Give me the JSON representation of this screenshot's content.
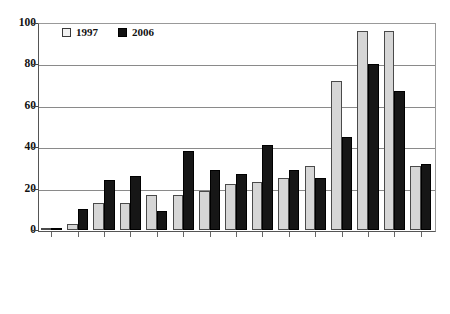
{
  "chart_data": {
    "type": "bar",
    "title": "",
    "subtitle": "",
    "xlabel": "",
    "ylabel": "",
    "ylim": [
      0,
      100
    ],
    "yticks": [
      0,
      20,
      40,
      60,
      80,
      100
    ],
    "grid": true,
    "legend_position": "top-left",
    "categories": [
      "MYANMAR",
      "JAPAN",
      "CHINA",
      "INDIA",
      "BRUNEI",
      "KOREA",
      "PHILIPPINES",
      "INDONESIA",
      "MALAYSIA",
      "THAILAND",
      "HONGKONG",
      "LAOS",
      "SINGAPORE",
      "CAMBODIA",
      "AVERAGE"
    ],
    "series": [
      {
        "name": "1997",
        "color": "#d6d6d6",
        "values": [
          1,
          3,
          13,
          13,
          17,
          17,
          19,
          22,
          23,
          25,
          31,
          72,
          96,
          96,
          31
        ]
      },
      {
        "name": "2006",
        "color": "#161616",
        "values": [
          1,
          10,
          24,
          26,
          9,
          38,
          29,
          27,
          41,
          29,
          25,
          45,
          80,
          67,
          32
        ]
      }
    ]
  },
  "legend": {
    "entries": [
      {
        "label": "1997",
        "swatch": "light-square-icon"
      },
      {
        "label": "2006",
        "swatch": "dark-square-icon"
      }
    ]
  },
  "axes": {
    "y_tick_labels": [
      "0",
      "20",
      "40",
      "60",
      "80",
      "100"
    ]
  }
}
